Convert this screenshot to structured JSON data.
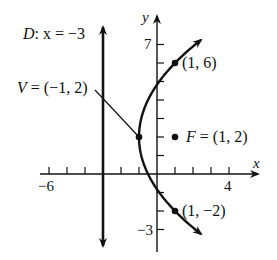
{
  "figure": {
    "type": "parabola-graph",
    "equation_form": "(y - 2)^2 = 8(x + 1)",
    "colors": {
      "ink": "#111111",
      "background": "#ffffff"
    }
  },
  "axes": {
    "x_label": "x",
    "y_label": "y",
    "x_tick_labels": [
      {
        "value": -6,
        "text": "−6"
      },
      {
        "value": 4,
        "text": "4"
      }
    ],
    "y_tick_labels": [
      {
        "value": 7,
        "text": "7"
      },
      {
        "value": -3,
        "text": "−3"
      }
    ],
    "x_ticks": [
      -6,
      -5,
      -4,
      -2,
      -1,
      1,
      2,
      3,
      4
    ],
    "y_ticks": [
      7,
      6,
      5,
      4,
      3,
      2,
      1,
      -1,
      -2,
      -3
    ],
    "x_range": [
      -6.5,
      5.7
    ],
    "y_range": [
      -4.2,
      8.6
    ]
  },
  "labels": {
    "directrix": {
      "name": "D",
      "rest": ": x = −3",
      "x_value": -3
    },
    "vertex": {
      "name": "V",
      "rest": " = (−1, 2)",
      "point": [
        -1,
        2
      ]
    },
    "focus": {
      "name": "F",
      "rest": " = (1, 2)",
      "point": [
        1,
        2
      ]
    },
    "point_upper": {
      "text": "(1, 6)",
      "point": [
        1,
        6
      ]
    },
    "point_lower": {
      "text": "(1, −2)",
      "point": [
        1,
        -2
      ]
    }
  },
  "points": [
    {
      "name": "vertex",
      "x": -1,
      "y": 2
    },
    {
      "name": "focus",
      "x": 1,
      "y": 2
    },
    {
      "name": "latus-upper",
      "x": 1,
      "y": 6
    },
    {
      "name": "latus-lower",
      "x": 1,
      "y": -2
    }
  ]
}
